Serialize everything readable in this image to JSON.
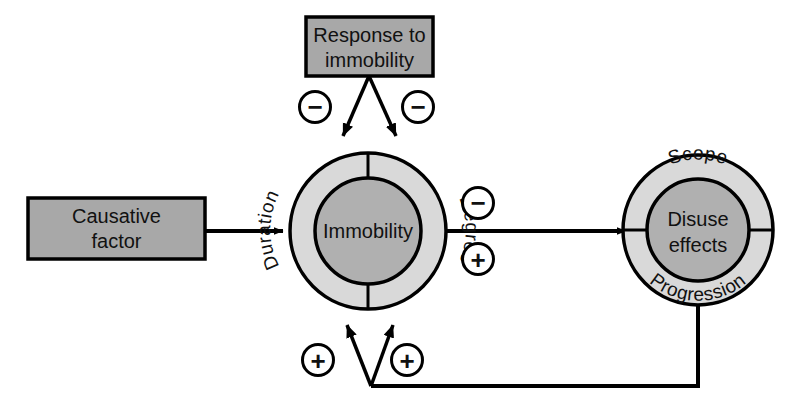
{
  "diagram": {
    "colors": {
      "box_fill": "#a8a8a8",
      "ring_fill": "#d9d9d9",
      "core_fill": "#b0b0b0",
      "stroke": "#000000",
      "background": "#ffffff",
      "text": "#111111"
    },
    "boxes": [
      {
        "id": "causative-factor",
        "line1": "Causative",
        "line2": "factor"
      },
      {
        "id": "response-to-immobility",
        "line1": "Response to",
        "line2": "immobility"
      }
    ],
    "nodes": [
      {
        "id": "immobility",
        "core_line1": "Immobility",
        "core_line2": "",
        "ring_left": "Duration",
        "ring_right": "Degree"
      },
      {
        "id": "disuse-effects",
        "core_line1": "Disuse",
        "core_line2": "effects",
        "ring_top": "Scope",
        "ring_bottom": "Progression"
      }
    ],
    "signs": [
      {
        "id": "sign-top-left",
        "symbol": "−",
        "polarity": "negative"
      },
      {
        "id": "sign-top-right",
        "symbol": "−",
        "polarity": "negative"
      },
      {
        "id": "sign-mid-upper",
        "symbol": "−",
        "polarity": "negative"
      },
      {
        "id": "sign-mid-lower",
        "symbol": "+",
        "polarity": "positive"
      },
      {
        "id": "sign-bottom-left",
        "symbol": "+",
        "polarity": "positive"
      },
      {
        "id": "sign-bottom-right",
        "symbol": "+",
        "polarity": "positive"
      }
    ]
  }
}
